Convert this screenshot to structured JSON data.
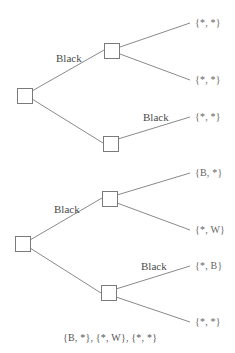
{
  "diagram": {
    "type": "decision-trees",
    "colors": {
      "edge": "#8a8a8a",
      "node_border": "#7a7a7a",
      "text": "#555555"
    },
    "trees": [
      {
        "name": "top-tree",
        "edge_labels": [
          "Black",
          "Black"
        ],
        "leaves": [
          "{*, *}",
          "{*, *}",
          "{*, *}"
        ]
      },
      {
        "name": "bottom-tree",
        "edge_labels": [
          "Black",
          "Black"
        ],
        "leaves": [
          "{B, *}",
          "{*, W}",
          "{*, B}",
          "{*, *}"
        ],
        "caption": "{B, *}, {*, W}, {*, *}"
      }
    ]
  }
}
